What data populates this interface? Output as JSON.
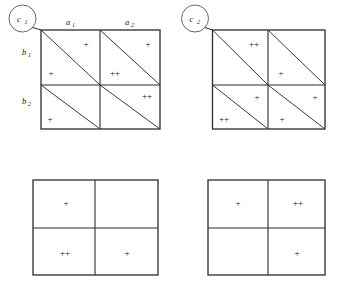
{
  "figure": {
    "type": "two-by-two-contingency-diagrams",
    "nodes": [
      {
        "id": "c1",
        "label": "c",
        "subscript": "1"
      },
      {
        "id": "c2",
        "label": "c",
        "subscript": "2"
      }
    ],
    "column_labels": [
      {
        "label": "a",
        "subscript": "1"
      },
      {
        "label": "a",
        "subscript": "2"
      }
    ],
    "row_labels": [
      {
        "label": "b",
        "subscript": "1"
      },
      {
        "label": "b",
        "subscript": "2"
      }
    ],
    "signs": {
      "single": "+",
      "double": "++"
    },
    "panels": [
      {
        "id": "panel-c1",
        "node": "c1",
        "has_diagonals": true,
        "has_axis_labels": true,
        "cells": [
          {
            "row": 1,
            "col": 1,
            "upper": "+",
            "lower": "+"
          },
          {
            "row": 1,
            "col": 2,
            "upper": "+",
            "lower": "++"
          },
          {
            "row": 2,
            "col": 1,
            "upper": "",
            "lower": "+"
          },
          {
            "row": 2,
            "col": 2,
            "upper": "++",
            "lower": ""
          }
        ]
      },
      {
        "id": "panel-c2",
        "node": "c2",
        "has_diagonals": true,
        "has_axis_labels": false,
        "cells": [
          {
            "row": 1,
            "col": 1,
            "upper": "++",
            "lower": ""
          },
          {
            "row": 1,
            "col": 2,
            "upper": "",
            "lower": "+"
          },
          {
            "row": 2,
            "col": 1,
            "upper": "+",
            "lower": "++"
          },
          {
            "row": 2,
            "col": 2,
            "upper": "+",
            "lower": "+"
          }
        ]
      },
      {
        "id": "panel-bottom-left",
        "node": "",
        "has_diagonals": false,
        "has_axis_labels": false,
        "cells": [
          {
            "row": 1,
            "col": 1,
            "value": "+"
          },
          {
            "row": 1,
            "col": 2,
            "value": ""
          },
          {
            "row": 2,
            "col": 1,
            "value": "++"
          },
          {
            "row": 2,
            "col": 2,
            "value": "+"
          }
        ]
      },
      {
        "id": "panel-bottom-right",
        "node": "",
        "has_diagonals": false,
        "has_axis_labels": false,
        "cells": [
          {
            "row": 1,
            "col": 1,
            "value": "+"
          },
          {
            "row": 1,
            "col": 2,
            "value": "++"
          },
          {
            "row": 2,
            "col": 1,
            "value": ""
          },
          {
            "row": 2,
            "col": 2,
            "value": "+"
          }
        ]
      }
    ],
    "colors": {
      "background": "#ffffff",
      "line": "#2b2b2b",
      "diagonal": "#3a3a3a",
      "text": "#111111"
    }
  }
}
